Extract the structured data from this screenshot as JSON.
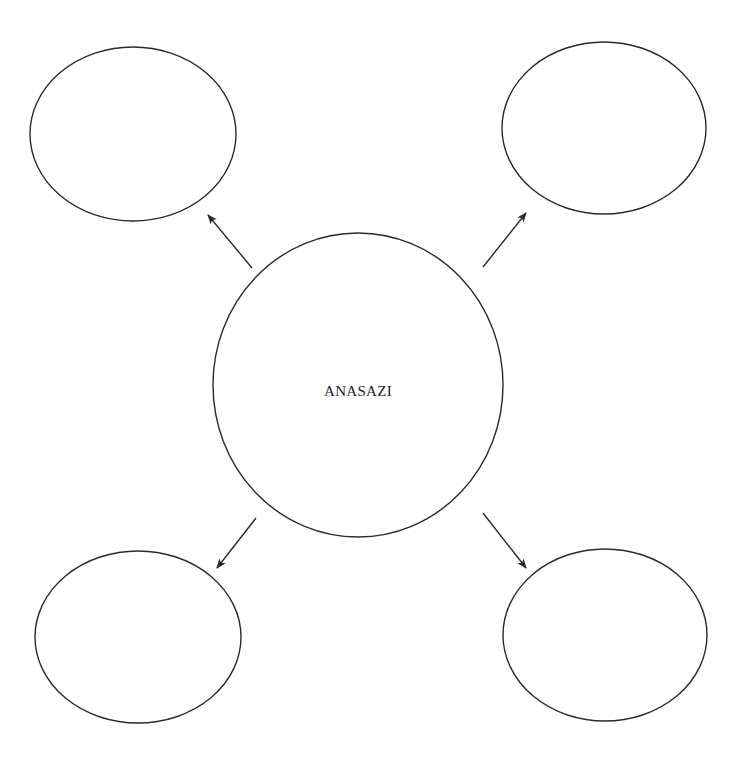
{
  "diagram": {
    "type": "concept-web",
    "stroke_color": "#2a2a2a",
    "background": "#ffffff",
    "center": {
      "label": "ANASAZI",
      "cx": 358,
      "cy": 385,
      "rx": 145,
      "ry": 152
    },
    "satellites": [
      {
        "id": "top-left",
        "label": "",
        "cx": 133,
        "cy": 134,
        "rx": 103,
        "ry": 87
      },
      {
        "id": "top-right",
        "label": "",
        "cx": 604,
        "cy": 128,
        "rx": 102,
        "ry": 86
      },
      {
        "id": "bottom-left",
        "label": "",
        "cx": 138,
        "cy": 637,
        "rx": 103,
        "ry": 86
      },
      {
        "id": "bottom-right",
        "label": "",
        "cx": 605,
        "cy": 635,
        "rx": 102,
        "ry": 86
      }
    ],
    "arrows": [
      {
        "to": "top-left",
        "x1": 252,
        "y1": 268,
        "x2": 208,
        "y2": 215
      },
      {
        "to": "top-right",
        "x1": 483,
        "y1": 267,
        "x2": 526,
        "y2": 213
      },
      {
        "to": "bottom-left",
        "x1": 256,
        "y1": 518,
        "x2": 217,
        "y2": 568
      },
      {
        "to": "bottom-right",
        "x1": 483,
        "y1": 513,
        "x2": 526,
        "y2": 568
      }
    ]
  }
}
